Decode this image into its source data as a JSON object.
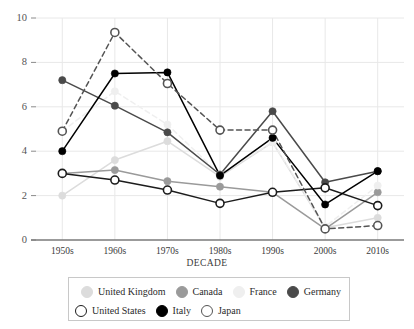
{
  "chart_data": {
    "type": "line",
    "title": "",
    "xlabel": "DECADE",
    "ylabel": "",
    "categories": [
      "1950s",
      "1960s",
      "1970s",
      "1980s",
      "1990s",
      "2000s",
      "2010s"
    ],
    "ylim": [
      0,
      10
    ],
    "yticks": [
      0,
      2,
      4,
      6,
      8,
      10
    ],
    "grid": true,
    "legend_position": "bottom",
    "series": [
      {
        "name": "United Kingdom",
        "color": "#dcdcdc",
        "marker": "filled-circle",
        "linestyle": "solid",
        "values": [
          2.0,
          3.6,
          4.45,
          2.85,
          4.4,
          0.55,
          1.0
        ]
      },
      {
        "name": "Canada",
        "color": "#9a9a9a",
        "marker": "filled-circle",
        "linestyle": "solid",
        "values": [
          3.0,
          3.15,
          2.65,
          2.4,
          2.15,
          0.5,
          2.15
        ]
      },
      {
        "name": "France",
        "color": "#efefef",
        "marker": "filled-circle",
        "linestyle": "dashed",
        "values": [
          4.9,
          6.7,
          5.2,
          2.95,
          4.4,
          0.6,
          2.45
        ]
      },
      {
        "name": "Germany",
        "color": "#4a4a4a",
        "marker": "filled-circle",
        "linestyle": "solid",
        "values": [
          7.2,
          6.05,
          4.85,
          2.95,
          5.8,
          2.6,
          3.1
        ]
      },
      {
        "name": "United States",
        "color": "#1c1c1c",
        "marker": "open-circle",
        "linestyle": "solid",
        "values": [
          3.0,
          2.7,
          2.25,
          1.65,
          2.15,
          2.35,
          1.55
        ]
      },
      {
        "name": "Italy",
        "color": "#000000",
        "marker": "filled-circle",
        "linestyle": "solid",
        "values": [
          4.0,
          7.5,
          7.55,
          2.9,
          4.6,
          1.6,
          3.1
        ]
      },
      {
        "name": "Japan",
        "color": "#545454",
        "marker": "open-circle",
        "linestyle": "dashed",
        "values": [
          4.9,
          9.35,
          7.05,
          4.95,
          4.95,
          0.5,
          0.65
        ]
      }
    ]
  },
  "legend": {
    "rows": [
      [
        "United Kingdom",
        "Canada",
        "France",
        "Germany"
      ],
      [
        "United States",
        "Italy",
        "Japan"
      ]
    ]
  },
  "colors": {
    "grid": "#e8e8e8",
    "axis": "#8a8a8a",
    "tick_text": "#545454",
    "legend_border": "#c8c8c8",
    "background": "#ffffff"
  }
}
